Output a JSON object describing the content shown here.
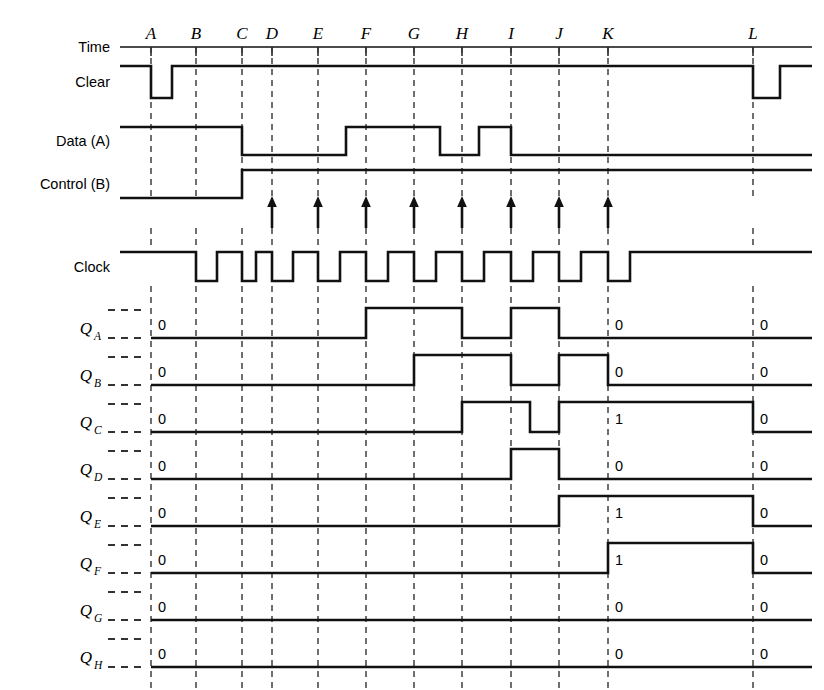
{
  "figure": {
    "type": "timing-diagram",
    "width": 824,
    "height": 690,
    "line_color": "#111111",
    "dash_color": "#333333",
    "background": "#ffffff"
  },
  "time_axis": {
    "label": "Time",
    "markers": [
      "A",
      "B",
      "C",
      "D",
      "E",
      "F",
      "G",
      "H",
      "I",
      "J",
      "K",
      "L"
    ],
    "marker_x": [
      151,
      196,
      242,
      272,
      318,
      366,
      414,
      462,
      511,
      559,
      608,
      753
    ],
    "axis_y": 47,
    "axis_x_start": 120,
    "axis_x_end": 812
  },
  "signals": [
    {
      "name": "clear",
      "label": "Clear",
      "row_y_top": 66,
      "row_y_bottom": 98,
      "initial": 1,
      "transitions": [
        {
          "x": 151,
          "to": 0
        },
        {
          "x": 172,
          "to": 1
        },
        {
          "x": 753,
          "to": 0
        },
        {
          "x": 780,
          "to": 1
        }
      ],
      "end_x": 812,
      "start_x": 120
    },
    {
      "name": "data_a",
      "label": "Data (A)",
      "row_y_top": 127,
      "row_y_bottom": 155,
      "initial": 1,
      "transitions": [
        {
          "x": 242,
          "to": 0
        },
        {
          "x": 346,
          "to": 1
        },
        {
          "x": 440,
          "to": 0
        },
        {
          "x": 479,
          "to": 1
        },
        {
          "x": 511,
          "to": 0
        }
      ],
      "end_x": 812,
      "start_x": 120
    },
    {
      "name": "control_b",
      "label": "Control (B)",
      "row_y_top": 170,
      "row_y_bottom": 198,
      "initial": 0,
      "transitions": [
        {
          "x": 242,
          "to": 1
        }
      ],
      "end_x": 812,
      "start_x": 120
    },
    {
      "name": "clock",
      "label": "Clock",
      "row_y_top": 252,
      "row_y_bottom": 281,
      "initial": 1,
      "pulse_markers": [
        "B",
        "C",
        "D",
        "E",
        "F",
        "G",
        "H",
        "I",
        "J",
        "K"
      ],
      "end_x": 812,
      "start_x": 120
    }
  ],
  "arrows": {
    "name": "clock-edge-arrows",
    "count": 8,
    "markers": [
      "D",
      "E",
      "F",
      "G",
      "H",
      "I",
      "J",
      "K"
    ],
    "x": [
      272,
      318,
      366,
      414,
      462,
      511,
      559,
      608
    ],
    "y_tip": 196,
    "y_base": 228
  },
  "outputs": [
    {
      "name": "qa",
      "label": "Q",
      "subscript": "A",
      "baseline_y": 338,
      "high_y": 308,
      "initial_value": "0",
      "value_at_k": "0",
      "value_at_l": "0",
      "transitions": [
        {
          "x": 366,
          "to": 1
        },
        {
          "x": 462,
          "to": 0
        },
        {
          "x": 511,
          "to": 1
        },
        {
          "x": 559,
          "to": 0
        }
      ]
    },
    {
      "name": "qb",
      "label": "Q",
      "subscript": "B",
      "baseline_y": 385,
      "high_y": 355,
      "initial_value": "0",
      "value_at_k": "0",
      "value_at_l": "0",
      "transitions": [
        {
          "x": 414,
          "to": 1
        },
        {
          "x": 511,
          "to": 0
        },
        {
          "x": 559,
          "to": 1
        },
        {
          "x": 608,
          "to": 0
        }
      ]
    },
    {
      "name": "qc",
      "label": "Q",
      "subscript": "C",
      "baseline_y": 432,
      "high_y": 402,
      "initial_value": "0",
      "value_at_k": "1",
      "value_at_l": "0",
      "transitions": [
        {
          "x": 462,
          "to": 1
        },
        {
          "x": 530,
          "to": 0
        },
        {
          "x": 559,
          "to": 1
        },
        {
          "x": 753,
          "to": 0
        }
      ]
    },
    {
      "name": "qd",
      "label": "Q",
      "subscript": "D",
      "baseline_y": 479,
      "high_y": 449,
      "initial_value": "0",
      "value_at_k": "0",
      "value_at_l": "0",
      "transitions": [
        {
          "x": 511,
          "to": 1
        },
        {
          "x": 559,
          "to": 0
        }
      ]
    },
    {
      "name": "qe",
      "label": "Q",
      "subscript": "E",
      "baseline_y": 526,
      "high_y": 496,
      "initial_value": "0",
      "value_at_k": "1",
      "value_at_l": "0",
      "transitions": [
        {
          "x": 559,
          "to": 1
        },
        {
          "x": 753,
          "to": 0
        }
      ]
    },
    {
      "name": "qf",
      "label": "Q",
      "subscript": "F",
      "baseline_y": 573,
      "high_y": 543,
      "initial_value": "0",
      "value_at_k": "1",
      "value_at_l": "0",
      "transitions": [
        {
          "x": 608,
          "to": 1
        },
        {
          "x": 753,
          "to": 0
        }
      ]
    },
    {
      "name": "qg",
      "label": "Q",
      "subscript": "G",
      "baseline_y": 620,
      "high_y": 590,
      "initial_value": "0",
      "value_at_k": "0",
      "value_at_l": "0",
      "transitions": []
    },
    {
      "name": "qh",
      "label": "Q",
      "subscript": "H",
      "baseline_y": 667,
      "high_y": 637,
      "initial_value": "0",
      "value_at_k": "0",
      "value_at_l": "0",
      "transitions": []
    }
  ],
  "output_area": {
    "wave_start_x": 151,
    "wave_end_x": 812,
    "value_label_k_x": 615,
    "value_label_l_x": 760,
    "initial_value_x": 158
  }
}
